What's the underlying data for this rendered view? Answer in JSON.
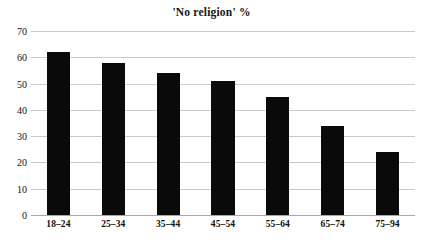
{
  "chart_data": {
    "type": "bar",
    "title": "'No religion' %",
    "xlabel": "",
    "ylabel": "",
    "categories": [
      "18–24",
      "25–34",
      "35–44",
      "45–54",
      "55–64",
      "65–74",
      "75–94"
    ],
    "values": [
      62,
      58,
      54,
      51,
      45,
      34,
      24
    ],
    "ylim": [
      0,
      70
    ],
    "yticks": [
      0,
      10,
      20,
      30,
      40,
      50,
      60,
      70
    ],
    "ytick_labels": [
      "0",
      "10",
      "20",
      "30",
      "40",
      "50",
      "60",
      "70"
    ],
    "grid": true,
    "legend": false,
    "legend_position": "none",
    "bar_color": "#0a0a0a",
    "gridline_color": "#c9c9c9",
    "background_color": "#ffffff"
  }
}
